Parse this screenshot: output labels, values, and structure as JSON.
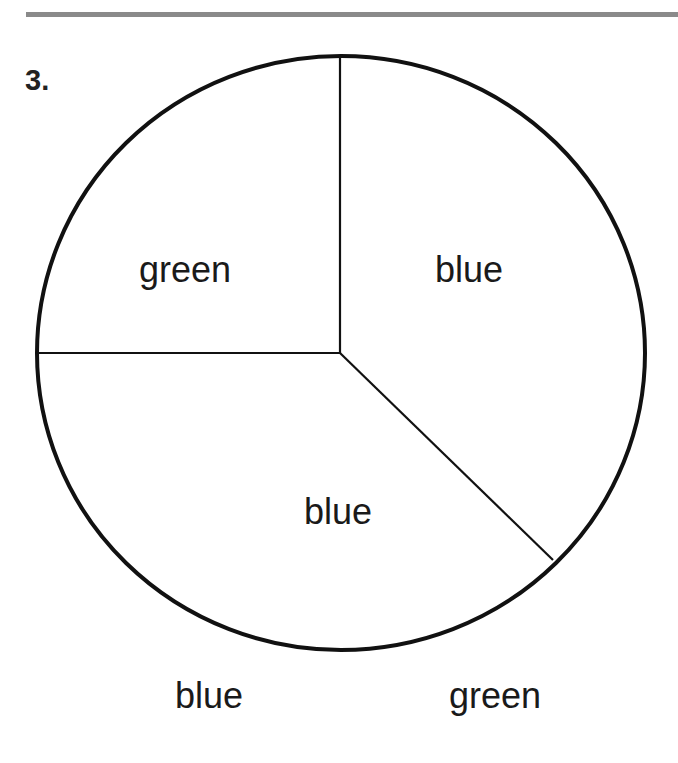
{
  "problem": {
    "number": "3."
  },
  "spinner": {
    "sections": [
      {
        "label": "green",
        "position": "upper-left"
      },
      {
        "label": "blue",
        "position": "right"
      },
      {
        "label": "blue",
        "position": "bottom"
      }
    ]
  },
  "choices": [
    {
      "label": "blue"
    },
    {
      "label": "green"
    }
  ],
  "colors": {
    "line": "#111111",
    "rule": "#8a8a8a",
    "text": "#1a1a1a"
  }
}
